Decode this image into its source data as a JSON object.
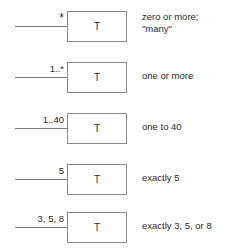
{
  "diagram": {
    "rows": [
      {
        "multiplicity": "*",
        "class_name": "T",
        "description": [
          "zero or more;",
          "\"many\""
        ]
      },
      {
        "multiplicity": "1..*",
        "class_name": "T",
        "description": [
          "one or more"
        ]
      },
      {
        "multiplicity": "1..40",
        "class_name": "T",
        "description": [
          "one to 40"
        ]
      },
      {
        "multiplicity": "5",
        "class_name": "T",
        "description": [
          "exactly 5"
        ]
      },
      {
        "multiplicity": "3, 5, 8",
        "class_name": "T",
        "description": [
          "exactly 3, 5, or 8"
        ]
      }
    ],
    "colors": {
      "line": "#7a7a7a",
      "box_border": "#8a8a8a",
      "text": "#2a2a2a",
      "background": "#ffffff"
    }
  }
}
